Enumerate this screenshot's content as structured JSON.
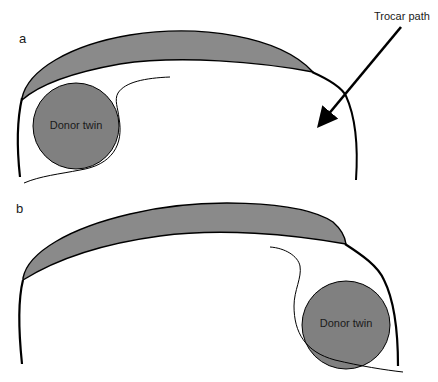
{
  "figure": {
    "panels": [
      {
        "letter": "a",
        "twin_label": "Donor twin",
        "annotation": "Trocar path"
      },
      {
        "letter": "b",
        "twin_label": "Donor twin"
      }
    ],
    "colors": {
      "placenta_fill": "#8a8a8a",
      "twin_fill": "#808080",
      "stroke": "#000000",
      "background": "#ffffff"
    }
  }
}
